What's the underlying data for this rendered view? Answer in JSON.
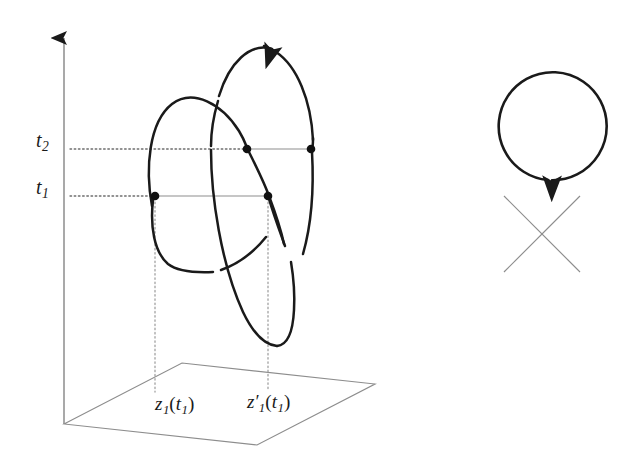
{
  "figure": {
    "title": "",
    "type": "mathematical-diagram",
    "background_color": "#ffffff",
    "stroke_color": "#1a1a1a",
    "thin_stroke_color": "#8a8a8a",
    "dotted_color": "#9a9a9a"
  },
  "axis": {
    "name": "vertical-time-axis",
    "x": 64,
    "top_y": 30,
    "bottom_y": 424,
    "arrow": "up",
    "ticks": [
      {
        "id": "t2",
        "label": "t",
        "subscript": "2",
        "y": 149
      },
      {
        "id": "t1",
        "label": "t",
        "subscript": "1",
        "y": 196
      }
    ]
  },
  "labels": {
    "t2": {
      "base": "t",
      "sub": "2"
    },
    "t1": {
      "base": "t",
      "sub": "1"
    },
    "z1_of_t1": {
      "base": "z",
      "sub": "1",
      "prime": "",
      "arg_open": "(",
      "arg_base": "t",
      "arg_sub": "1",
      "arg_close": ")"
    },
    "z1prime_of_t1": {
      "base": "z",
      "sub": "1",
      "prime": "′",
      "arg_open": "(",
      "arg_base": "t",
      "arg_sub": "1",
      "arg_close": ")"
    }
  },
  "ground_plane": {
    "name": "ground-plane-parallelogram",
    "corners": [
      {
        "x": 64,
        "y": 424
      },
      {
        "x": 182,
        "y": 363
      },
      {
        "x": 375,
        "y": 384
      },
      {
        "x": 257,
        "y": 445
      }
    ]
  },
  "level_lines": {
    "t2": {
      "dotted_from": {
        "x": 72,
        "y": 149
      },
      "dotted_to": {
        "x": 247,
        "y": 149
      },
      "solid_from": {
        "x": 247,
        "y": 149
      },
      "solid_to": {
        "x": 311,
        "y": 149
      }
    },
    "t1": {
      "dotted_from": {
        "x": 72,
        "y": 196
      },
      "dotted_to": {
        "x": 155,
        "y": 196
      },
      "solid_from": {
        "x": 155,
        "y": 196
      },
      "solid_to": {
        "x": 268,
        "y": 196
      }
    }
  },
  "marked_points": [
    {
      "name": "point-left-loop-t1",
      "x": 155,
      "y": 196,
      "level": "t1"
    },
    {
      "name": "point-right-loop-t1",
      "x": 268,
      "y": 196,
      "level": "t1"
    },
    {
      "name": "point-left-loop-t2",
      "x": 247,
      "y": 149,
      "level": "t2"
    },
    {
      "name": "point-right-loop-t2",
      "x": 311,
      "y": 149,
      "level": "t2"
    }
  ],
  "drop_lines": [
    {
      "name": "drop-line-z1",
      "x": 155,
      "from_y": 196,
      "to_y": 392
    },
    {
      "name": "drop-line-z1prime",
      "x": 268,
      "from_y": 196,
      "to_y": 390
    }
  ],
  "curves": {
    "left_loop": {
      "name": "left-closed-curve",
      "orientation": "tilted ellipse",
      "segments": 3
    },
    "right_loop": {
      "name": "right-closed-curve",
      "orientation": "tilted ellipse",
      "arrow_direction": "counterclockwise",
      "arrow_at": {
        "x": 262,
        "y": 47
      }
    }
  },
  "side_circle": {
    "name": "side-circle-with-chords",
    "center": {
      "x": 542,
      "y": 234
    },
    "radius": 54,
    "arrow_direction": "counterclockwise",
    "arrow_at": {
      "x": 547,
      "y": 181
    },
    "chords": [
      {
        "from_angle_deg": 135,
        "to_angle_deg": -45
      },
      {
        "from_angle_deg": 45,
        "to_angle_deg": -135
      }
    ]
  }
}
